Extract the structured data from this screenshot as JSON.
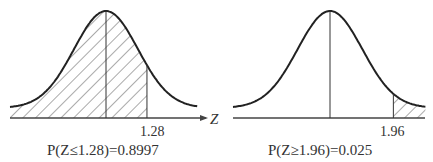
{
  "figures": [
    {
      "id": "left",
      "cutoff": 1.28,
      "cutoff_label": "1.28",
      "shaded_side": "left",
      "axis_label": "Z",
      "has_arrow": true,
      "caption": "P(Z≤1.28)=0.8997"
    },
    {
      "id": "right",
      "cutoff": 1.96,
      "cutoff_label": "1.96",
      "shaded_side": "right",
      "axis_label": "",
      "has_arrow": false,
      "caption": "P(Z≥1.96)=0.025"
    }
  ],
  "colors": {
    "curve": "#222222",
    "axis": "#444444",
    "hatch": "#555555",
    "text": "#333333"
  }
}
